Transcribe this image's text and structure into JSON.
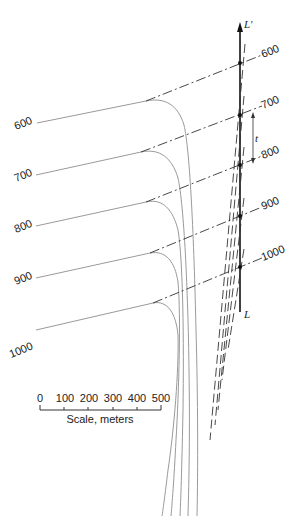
{
  "diagram": {
    "axis": {
      "top_label": "L'",
      "bottom_label": "L",
      "dimension_label": "t"
    },
    "contours": [
      {
        "label": "600"
      },
      {
        "label": "700"
      },
      {
        "label": "800"
      },
      {
        "label": "900"
      },
      {
        "label": "1000"
      }
    ],
    "right_labels": [
      "600",
      "700",
      "800",
      "900",
      "1000"
    ],
    "scale": {
      "ticks": [
        "0",
        "100",
        "200",
        "300",
        "400",
        "500"
      ],
      "caption": "Scale, meters"
    },
    "colors": {
      "curve": "#9a9a9a",
      "line": "#111111",
      "dash": "#333333"
    }
  }
}
